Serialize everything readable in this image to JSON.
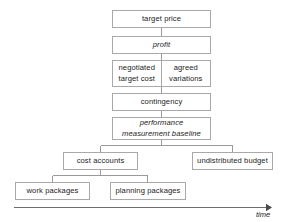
{
  "diagram": {
    "type": "hierarchy",
    "colors": {
      "box_border": "#a9a9a9",
      "box_fill": "#ffffff",
      "connector": "#9a9a9a",
      "text": "#1c1c1c",
      "axis": "#6e6e6e"
    },
    "nodes": {
      "target_price": "target price",
      "profit": "profit",
      "negotiated_target_cost": "negotiated\ntarget cost",
      "agreed_variations": "agreed\nvariations",
      "contingency": "contingency",
      "performance_measurement_baseline": "performance\nmeasurement baseline",
      "cost_accounts": "cost accounts",
      "undistributed_budget": "undistributed budget",
      "work_packages": "work packages",
      "planning_packages": "planning packages"
    },
    "axis": {
      "label": "time",
      "direction": "right"
    }
  }
}
